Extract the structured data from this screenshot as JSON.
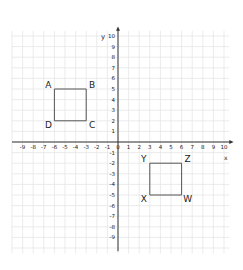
{
  "diagram": {
    "type": "coordinate-grid",
    "axes": {
      "x_label": "x",
      "y_label": "y",
      "x_ticks": [
        -9,
        -8,
        -7,
        -6,
        -5,
        -4,
        -3,
        -2,
        -1,
        0,
        1,
        2,
        3,
        4,
        5,
        6,
        7,
        8,
        9,
        10
      ],
      "y_ticks_positive": [
        1,
        2,
        3,
        4,
        5,
        6,
        7,
        8,
        9,
        10
      ],
      "y_ticks_negative": [
        -1,
        -2,
        -3,
        -4,
        -5,
        -6,
        -7,
        -8,
        -9
      ],
      "x_range": [
        -10,
        10
      ],
      "y_range": [
        -10,
        10
      ]
    },
    "shapes": [
      {
        "name": "ABCD",
        "vertices": [
          {
            "label": "A",
            "x": -6,
            "y": 5
          },
          {
            "label": "B",
            "x": -3,
            "y": 5
          },
          {
            "label": "C",
            "x": -3,
            "y": 2
          },
          {
            "label": "D",
            "x": -6,
            "y": 2
          }
        ]
      },
      {
        "name": "YZWX",
        "vertices": [
          {
            "label": "Y",
            "x": 3,
            "y": -2
          },
          {
            "label": "Z",
            "x": 6,
            "y": -2
          },
          {
            "label": "W",
            "x": 6,
            "y": -5
          },
          {
            "label": "X",
            "x": 3,
            "y": -5
          }
        ]
      }
    ],
    "colors": {
      "grid": "#e6e6e6",
      "axis": "#333333",
      "shape": "#555555",
      "text": "#222222"
    }
  }
}
